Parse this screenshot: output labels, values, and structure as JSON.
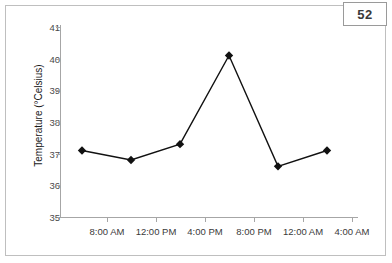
{
  "badge": {
    "label": "52"
  },
  "chart_data": {
    "type": "line",
    "title": "",
    "xlabel": "",
    "ylabel": "Temperature (°Celsius)",
    "ylim": [
      35,
      41
    ],
    "ytick_labels": [
      "41",
      "40",
      "39",
      "38",
      "37",
      "36",
      "35"
    ],
    "ytick_values": [
      41,
      40,
      39,
      38,
      37,
      36,
      35
    ],
    "xtick_labels": [
      "8:00 AM",
      "12:00 PM",
      "4:00 PM",
      "8:00 PM",
      "12:00 AM",
      "4:00 AM"
    ],
    "grid": false,
    "legend": "none",
    "marker": "diamond",
    "line_color": "#111111",
    "marker_color": "#111111",
    "categories": [
      "6:00 AM",
      "10:00 AM",
      "2:00 PM",
      "6:00 PM",
      "10:00 PM",
      "2:00 AM"
    ],
    "values": [
      37.1,
      36.8,
      37.3,
      40.1,
      36.6,
      37.1
    ],
    "series": [
      {
        "name": "Temperature",
        "values": [
          37.1,
          36.8,
          37.3,
          40.1,
          36.6,
          37.1
        ]
      }
    ]
  }
}
